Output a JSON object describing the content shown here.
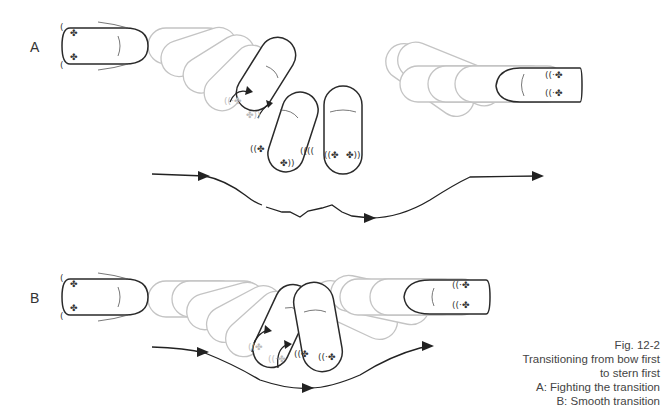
{
  "figure": {
    "panel_a_label": "A",
    "panel_b_label": "B",
    "caption": {
      "line1": "Fig. 12-2",
      "line2": "Transitioning from bow first",
      "line3": "to stern first",
      "line4": "A: Fighting the transition",
      "line5": "B: Smooth transition"
    },
    "icons": {
      "thruster": "propeller-thrust-icon",
      "wave": "wake-wave-icon"
    },
    "colors": {
      "ink": "#2a2a2a",
      "ghost": "#c4c4c4",
      "caption_text": "#444444"
    }
  }
}
